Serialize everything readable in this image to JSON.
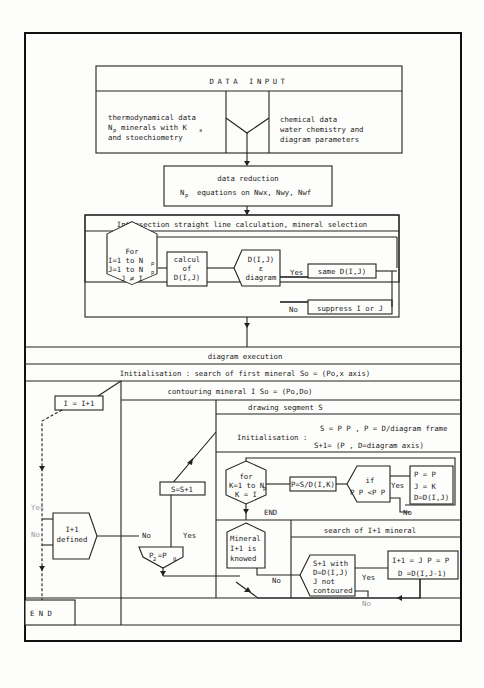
{
  "data_input": {
    "title": "DATA INPUT",
    "left": [
      "thermodynamical data",
      "N",
      "minerals with K",
      "and stoechiometry"
    ],
    "left_sub": [
      "p",
      "s"
    ],
    "right": [
      "chemical data",
      "water chemistry and",
      "diagram parameters"
    ]
  },
  "data_reduction": {
    "line1": "data reduction",
    "line2_prefix": "N",
    "line2_sub": "p",
    "line2": "equations on Nwx, Nwy, Nwf"
  },
  "intersection": {
    "title": "Intersection straight line calculation, mineral selection",
    "for_box": [
      "For",
      "I=1 to N",
      "J=1 to N",
      "J ≠ I"
    ],
    "for_sub": "p",
    "calcul": [
      "calcul",
      "of",
      "D(I,J)"
    ],
    "decision": [
      "D(I,J)",
      "ε",
      "diagram"
    ],
    "yes": "Yes",
    "no": "No",
    "same": "same D(I,J)",
    "suppress": "suppress I or J"
  },
  "execution": {
    "title": "diagram execution",
    "init": "Initialisation : search of first mineral So = (Po,x axis)",
    "contouring": "contouring mineral I So = (Po,Do)",
    "i_inc": "I = I+1",
    "defined": [
      "I+1",
      "defined"
    ],
    "yes_left": "Yes",
    "no_left": "No",
    "end": "E N D",
    "s_inc": "S=S+1",
    "p2p0": "P  =P",
    "p2p0_subs": [
      "2",
      "0"
    ],
    "no_mid": "No",
    "yes_mid": "Yes"
  },
  "drawing": {
    "title": "drawing segment S",
    "init_label": "Initialisation :",
    "init_line1": "S = P P , P = D/diagram frame",
    "init_line2": "S+1= (P , D=diagram axis)",
    "for_k": [
      "for",
      "K=1 to N",
      "K = I"
    ],
    "for_k_sub": "p",
    "end": "END",
    "p_calc": "P=S/D(I,K)",
    "if": [
      "if",
      "P P <P P"
    ],
    "yes": "Yes",
    "no": "No",
    "assign": [
      "P  = P",
      "J = K",
      "D=D(I,J)"
    ]
  },
  "search": {
    "mineral_known": [
      "Mineral",
      "I+1 is",
      "knowed"
    ],
    "no": "No",
    "title": "search of I+1 mineral",
    "cond": [
      "S+1 with",
      "D=D(I,J)",
      "J not",
      "contoured"
    ],
    "yes": "Yes",
    "no2": "No",
    "result1": "I+1 = J P  = P",
    "result2": "D =D(I,J-1)"
  }
}
